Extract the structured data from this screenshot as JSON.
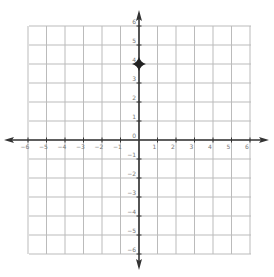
{
  "chart_data": {
    "type": "scatter",
    "title": "",
    "xlabel": "",
    "ylabel": "",
    "xlim": [
      -6,
      6
    ],
    "ylim": [
      -6,
      6
    ],
    "grid": true,
    "x_ticks": [
      "-6",
      "-5",
      "-4",
      "-3",
      "-2",
      "-1",
      "1",
      "2",
      "3",
      "4",
      "5",
      "6"
    ],
    "y_ticks": [
      "6",
      "5",
      "4",
      "3",
      "2",
      "1",
      "0",
      "-1",
      "-2",
      "-3",
      "-4",
      "-5",
      "-6"
    ],
    "points": [
      {
        "x": 0,
        "y": 4,
        "marker": "four-point-star"
      }
    ]
  },
  "colors": {
    "grid": "#bbbbbb",
    "axis": "#333333",
    "label": "#777777",
    "point": "#222222"
  }
}
